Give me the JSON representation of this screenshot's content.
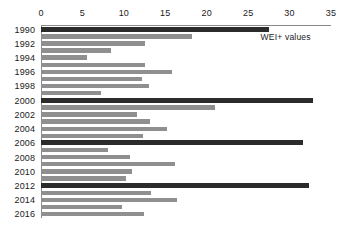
{
  "chart_data": {
    "type": "bar",
    "orientation": "horizontal",
    "title": "",
    "xlabel": "",
    "ylabel": "",
    "xlim": [
      0,
      35
    ],
    "xticks": [
      0,
      5,
      10,
      15,
      20,
      25,
      30,
      35
    ],
    "grid": false,
    "legend": "none",
    "annotations": [
      {
        "text": "WEI+ values",
        "x": 26.5,
        "y": 1991
      }
    ],
    "categories": [
      "1990",
      "1991",
      "1992",
      "1993",
      "1994",
      "1995",
      "1996",
      "1997",
      "1998",
      "1999",
      "2000",
      "2001",
      "2002",
      "2003",
      "2004",
      "2005",
      "2006",
      "2007",
      "2008",
      "2009",
      "2010",
      "2011",
      "2012",
      "2013",
      "2014",
      "2015",
      "2016"
    ],
    "visible_ticklabels": [
      "1990",
      "1992",
      "1994",
      "1996",
      "1998",
      "2000",
      "2002",
      "2004",
      "2006",
      "2008",
      "2010",
      "2012",
      "2014",
      "2016"
    ],
    "values": [
      27.5,
      18.2,
      12.5,
      8.4,
      5.5,
      12.6,
      15.8,
      12.2,
      13.0,
      7.3,
      32.8,
      21.0,
      11.6,
      13.1,
      15.2,
      12.3,
      31.6,
      8.1,
      10.8,
      16.2,
      11.0,
      10.3,
      32.4,
      13.3,
      16.4,
      9.8,
      12.4
    ],
    "highlighted_categories": [
      "1990",
      "2000",
      "2006",
      "2012"
    ],
    "colors": {
      "bar": "#8f8f8f",
      "bar_highlight": "#2b2b2b",
      "axis": "#8a8a8a",
      "text": "#1a1a1a",
      "background": "#ffffff"
    }
  }
}
